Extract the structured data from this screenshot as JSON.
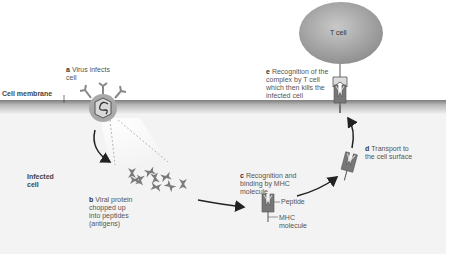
{
  "diagram": {
    "colors": {
      "membrane_dark": "#8a8a8a",
      "cytoplasm": "#f1f1f1",
      "tcell": "#a8a8a8",
      "virus_ring": "#9a9a9a",
      "mhc": "#777777",
      "peptide": "#888888",
      "arrow": "#222222"
    },
    "regions": {
      "membrane_label": "Cell membrane",
      "infected_cell_label": "Infected\ncell",
      "tcell_label": "T cell"
    },
    "steps": [
      {
        "letter": "a",
        "text": "Virus infects\ncell"
      },
      {
        "letter": "b",
        "text": "Viral protein\nchopped up\ninto peptides\n(antigens)"
      },
      {
        "letter": "c",
        "text": "Recognition and\nbinding by MHC\nmolecule"
      },
      {
        "letter": "d",
        "text": "Transport to\nthe cell surface"
      },
      {
        "letter": "e",
        "text": "Recognition of the\ncomplex by T cell\nwhich then kills the\ninfected cell"
      }
    ],
    "callouts": {
      "peptide": "Peptide",
      "mhc": "MHC\nmolecule"
    }
  }
}
